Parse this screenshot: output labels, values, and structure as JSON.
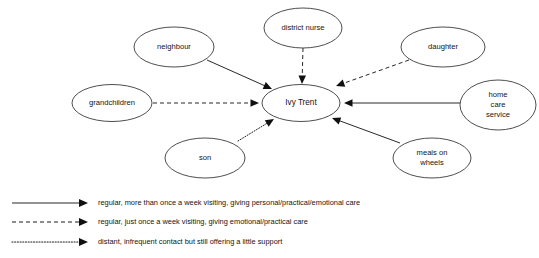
{
  "diagram": {
    "type": "ego-network-diagram",
    "center": {
      "id": "ivy-trent",
      "label": "Ivy Trent",
      "cx": 301,
      "cy": 103,
      "rx": 39,
      "ry": 18.5
    },
    "nodes": [
      {
        "id": "district-nurse",
        "label": "district nurse",
        "lines": [
          "district nurse"
        ],
        "cx": 303,
        "cy": 28,
        "rx": 39,
        "ry": 20
      },
      {
        "id": "neighbour",
        "label": "neighbour",
        "lines": [
          "neighbour"
        ],
        "cx": 174,
        "cy": 47,
        "rx": 40,
        "ry": 20
      },
      {
        "id": "daughter",
        "label": "daughter",
        "lines": [
          "daughter"
        ],
        "cx": 443,
        "cy": 47,
        "rx": 42,
        "ry": 20
      },
      {
        "id": "grandchildren",
        "label": "grandchildren",
        "lines": [
          "grandchildren"
        ],
        "cx": 112,
        "cy": 103,
        "rx": 40,
        "ry": 18.5
      },
      {
        "id": "home-care-service",
        "label": "home care service",
        "lines": [
          "home",
          "care",
          "service"
        ],
        "cx": 498,
        "cy": 105,
        "rx": 38,
        "ry": 25
      },
      {
        "id": "son",
        "label": "son",
        "lines": [
          "son"
        ],
        "cx": 205,
        "cy": 158,
        "rx": 40,
        "ry": 20
      },
      {
        "id": "meals-on-wheels",
        "label": "meals on wheels",
        "lines": [
          "meals on",
          "wheels"
        ],
        "cx": 432,
        "cy": 158,
        "rx": 39,
        "ry": 20
      }
    ],
    "edges": [
      {
        "id": "edge-district-nurse",
        "from": "district nurse",
        "to": "Ivy Trent",
        "style": "dashed",
        "x1": 303,
        "y1": 48,
        "x2": 302,
        "y2": 84
      },
      {
        "id": "edge-neighbour",
        "from": "neighbour",
        "to": "Ivy Trent",
        "style": "solid",
        "x1": 207,
        "y1": 60,
        "x2": 272,
        "y2": 89
      },
      {
        "id": "edge-daughter",
        "from": "daughter",
        "to": "Ivy Trent",
        "style": "dashed",
        "x1": 409,
        "y1": 60,
        "x2": 336,
        "y2": 86
      },
      {
        "id": "edge-grandchildren",
        "from": "grandchildren",
        "to": "Ivy Trent",
        "style": "dashed",
        "x1": 153,
        "y1": 103,
        "x2": 259,
        "y2": 103
      },
      {
        "id": "edge-home-care-service",
        "from": "home care service",
        "to": "Ivy Trent",
        "style": "solid",
        "x1": 460,
        "y1": 103,
        "x2": 344,
        "y2": 103
      },
      {
        "id": "edge-son",
        "from": "son",
        "to": "Ivy Trent",
        "style": "dotted",
        "x1": 238,
        "y1": 141,
        "x2": 274,
        "y2": 119
      },
      {
        "id": "edge-meals-on-wheels",
        "from": "meals on wheels",
        "to": "Ivy Trent",
        "style": "solid",
        "x1": 400,
        "y1": 143,
        "x2": 332,
        "y2": 118
      }
    ],
    "legend": [
      {
        "id": "legend-solid",
        "style": "solid",
        "text": "regular, more than once a week visiting, giving personal/practical/emotional care"
      },
      {
        "id": "legend-dashed",
        "style": "dashed",
        "text": "regular, just once a week visiting, giving emotional/practical care"
      },
      {
        "id": "legend-dotted",
        "style": "dotted",
        "text": "distant, infrequent contact but still offering a little support"
      }
    ]
  },
  "colors": {
    "background": "#ffffff",
    "node_stroke": "#3a3a3a",
    "node_fill": "#ffffff",
    "edge_stroke": "#1c1c1c",
    "text": "#141414"
  }
}
